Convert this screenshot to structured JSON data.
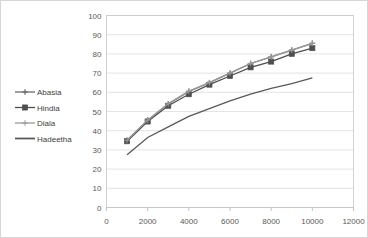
{
  "chart_data": {
    "type": "line",
    "title": "",
    "xlabel": "",
    "ylabel": "",
    "xlim": [
      0,
      12000
    ],
    "ylim": [
      0,
      100
    ],
    "grid": true,
    "legend_position": "left-outside",
    "x_ticks": [
      "0",
      "2000",
      "4000",
      "6000",
      "8000",
      "10000",
      "12000"
    ],
    "x_tick_values": [
      0,
      2000,
      4000,
      6000,
      8000,
      10000,
      12000
    ],
    "y_ticks": [
      "0",
      "10",
      "20",
      "30",
      "40",
      "50",
      "60",
      "70",
      "80",
      "90",
      "100"
    ],
    "y_tick_values": [
      0,
      10,
      20,
      30,
      40,
      50,
      60,
      70,
      80,
      90,
      100
    ],
    "x": [
      1000,
      2000,
      3000,
      4000,
      5000,
      6000,
      7000,
      8000,
      9000,
      10000
    ],
    "series": [
      {
        "name": "Abasia",
        "marker": "plus",
        "color": "#6d6d6d",
        "values": [
          35,
          45.5,
          54,
          60.5,
          65,
          70,
          75,
          78.5,
          82,
          85.5
        ]
      },
      {
        "name": "Hindia",
        "marker": "filled-square",
        "color": "#4f4f4f",
        "values": [
          34.5,
          44.8,
          53,
          59,
          64,
          68.5,
          73,
          76,
          80,
          83
        ]
      },
      {
        "name": "Diala",
        "marker": "light-plus",
        "color": "#9a9a9a",
        "values": [
          35,
          45.5,
          54,
          60.5,
          65,
          70,
          75,
          78.5,
          82,
          85.5
        ]
      },
      {
        "name": "Hadeetha",
        "marker": "none",
        "color": "#595959",
        "values": [
          27.5,
          36.5,
          42,
          47.5,
          51.5,
          55.5,
          59,
          62,
          64.5,
          67.5
        ]
      }
    ]
  },
  "legend": {
    "items": [
      {
        "label": "Abasia"
      },
      {
        "label": "Hindia"
      },
      {
        "label": "Diala"
      },
      {
        "label": "Hadeetha"
      }
    ]
  }
}
